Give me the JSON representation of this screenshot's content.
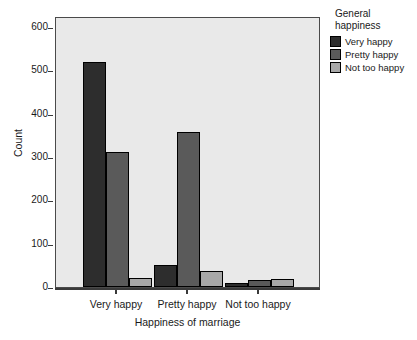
{
  "chart_data": {
    "type": "bar",
    "title": "",
    "xlabel": "Happiness of marriage",
    "ylabel": "Count",
    "categories": [
      "Very happy",
      "Pretty happy",
      "Not too happy"
    ],
    "series": [
      {
        "name": "Very happy",
        "values": [
          520,
          51,
          9
        ],
        "color": "#2d2d2d"
      },
      {
        "name": "Pretty happy",
        "values": [
          311,
          358,
          16
        ],
        "color": "#5a5a5a"
      },
      {
        "name": "Not too happy",
        "values": [
          21,
          37,
          19
        ],
        "color": "#a8a8a8"
      }
    ],
    "ylim": [
      0,
      600
    ],
    "yticks": [
      0,
      100,
      200,
      300,
      400,
      500,
      600
    ],
    "ytick_labels": [
      "0",
      "100",
      "200",
      "300",
      "400",
      "500",
      "600"
    ],
    "grid": false,
    "legend_position": "right",
    "panel_background": "#e9e9e9"
  },
  "legend": {
    "title_line1": "General",
    "title_line2": "happiness",
    "entries": [
      {
        "label": "Very happy"
      },
      {
        "label": "Pretty happy"
      },
      {
        "label": "Not too happy"
      }
    ]
  },
  "axes": {
    "y_title": "Count",
    "x_title": "Happiness of marriage"
  }
}
